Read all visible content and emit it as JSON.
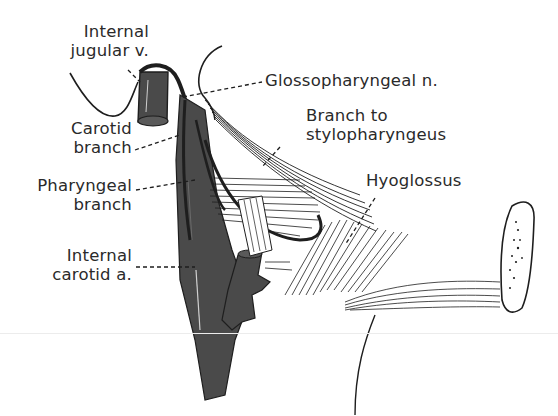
{
  "figure": {
    "type": "anatomical-illustration",
    "colors": {
      "vessel": "#4a4a4a",
      "line": "#1e1e1e",
      "text": "#2a2a2a",
      "background": "#ffffff"
    }
  },
  "labels": {
    "internal_jugular": {
      "line1": "Internal",
      "line2": "jugular v."
    },
    "glossopharyngeal": {
      "line1": "Glossopharyngeal n."
    },
    "carotid_branch": {
      "line1": "Carotid",
      "line2": "branch"
    },
    "branch_stylopharyngeus": {
      "line1": "Branch to",
      "line2": "stylopharyngeus"
    },
    "pharyngeal_branch": {
      "line1": "Pharyngeal",
      "line2": "branch"
    },
    "hyoglossus": {
      "line1": "Hyoglossus"
    },
    "internal_carotid": {
      "line1": "Internal",
      "line2": "carotid a."
    }
  }
}
